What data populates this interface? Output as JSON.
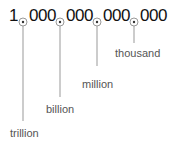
{
  "number": {
    "groups": [
      "1",
      "000",
      "000",
      "000",
      "000"
    ]
  },
  "labels": {
    "trillion": "trillion",
    "billion": "billion",
    "million": "million",
    "thousand": "thousand"
  },
  "colors": {
    "text": "#111111",
    "label": "#555555",
    "line": "#999999"
  }
}
